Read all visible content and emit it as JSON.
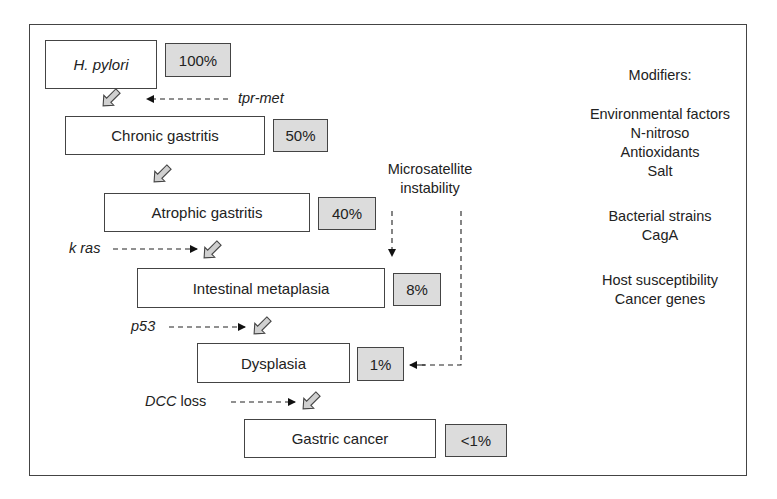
{
  "diagram": {
    "stages": [
      {
        "label": "H. pylori",
        "percent": "100%",
        "italic": true
      },
      {
        "label": "Chronic gastritis",
        "percent": "50%"
      },
      {
        "label": "Atrophic gastritis",
        "percent": "40%"
      },
      {
        "label": "Intestinal metaplasia",
        "percent": "8%"
      },
      {
        "label": "Dysplasia",
        "percent": "1%"
      },
      {
        "label": "Gastric cancer",
        "percent": "<1%"
      }
    ],
    "genetic_events": {
      "tpr_met": "tpr-met",
      "k_ras": "k ras",
      "p53": "p53",
      "dcc_italic": "DCC",
      "dcc_suffix": " loss"
    },
    "microsatellite": {
      "line1": "Microsatellite",
      "line2": "instability"
    },
    "modifiers": {
      "title": "Modifiers:",
      "groups": [
        {
          "heading": "Environmental factors",
          "items": [
            "N-nitroso",
            "Antioxidants",
            "Salt"
          ]
        },
        {
          "heading": "Bacterial strains",
          "items": [
            "CagA"
          ]
        },
        {
          "heading": "Host susceptibility",
          "items": [
            "Cancer genes"
          ]
        }
      ]
    },
    "colors": {
      "percent_fill": "#dcdcdc",
      "stage_fill": "#ffffff",
      "arrow_fill": "#d0d0d0",
      "stroke": "#444444"
    }
  }
}
